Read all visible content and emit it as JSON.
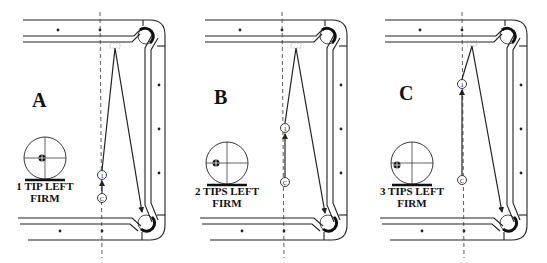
{
  "figure": {
    "colors": {
      "line": "#222222",
      "background": "#ffffff"
    },
    "panels": [
      {
        "id": "A",
        "letter": "A",
        "caption_line1": "1 TIP LEFT",
        "caption_line2": "FIRM",
        "offset_x": 0,
        "letter_pos": [
          40,
          103
        ],
        "english_dot": [
          42,
          158
        ],
        "diagram_center": [
          45,
          158
        ],
        "object_ball": {
          "label": "1",
          "x": 102,
          "y": 175
        },
        "cue_ball": {
          "label": "C",
          "x": 102,
          "y": 198
        },
        "apex": [
          115,
          48
        ],
        "end": [
          142,
          212
        ]
      },
      {
        "id": "B",
        "letter": "B",
        "caption_line1": "2 TIPS LEFT",
        "caption_line2": "FIRM",
        "offset_x": 182,
        "letter_pos": [
          40,
          100
        ],
        "english_dot": [
          34,
          163
        ],
        "diagram_center": [
          45,
          163
        ],
        "object_ball": {
          "label": "1",
          "x": 103,
          "y": 128
        },
        "cue_ball": {
          "label": "C",
          "x": 103,
          "y": 182
        },
        "apex": [
          114,
          48
        ],
        "end": [
          143,
          213
        ]
      },
      {
        "id": "C",
        "letter": "C",
        "caption_line1": "3 TIPS LEFT",
        "caption_line2": "FIRM",
        "offset_x": 362,
        "letter_pos": [
          45,
          96
        ],
        "english_dot": [
          35,
          165
        ],
        "diagram_center": [
          50,
          163
        ],
        "object_ball": {
          "label": "1",
          "x": 100,
          "y": 84
        },
        "cue_ball": {
          "label": "C",
          "x": 100,
          "y": 180
        },
        "apex": [
          110,
          46
        ],
        "end": [
          140,
          212
        ]
      }
    ]
  }
}
